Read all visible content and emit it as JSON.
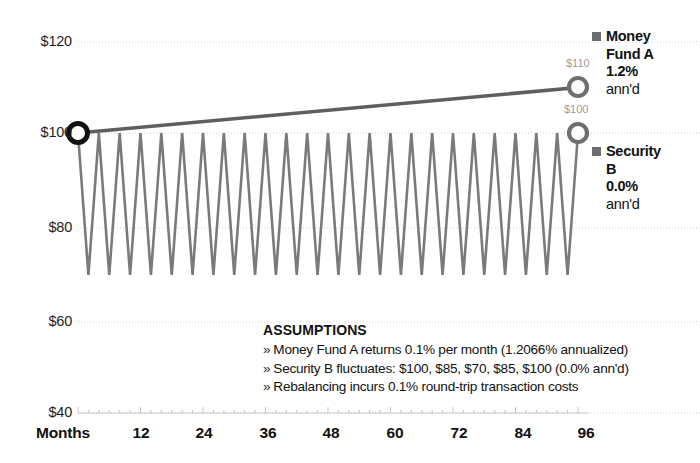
{
  "chart_data": {
    "type": "line",
    "title": "",
    "subtitle": "",
    "xlabel": "Months",
    "ylabel": "",
    "xlim": [
      0,
      96
    ],
    "ylim": [
      40,
      120
    ],
    "grid": true,
    "legend_position": "right",
    "y_ticks": [
      "$40",
      "$60",
      "$80",
      "$100",
      "$120"
    ],
    "y_tick_values": [
      40,
      60,
      80,
      100,
      120
    ],
    "x_ticks": [
      "12",
      "24",
      "36",
      "48",
      "60",
      "72",
      "84",
      "96"
    ],
    "x_tick_values": [
      12,
      24,
      36,
      48,
      60,
      72,
      84,
      96
    ],
    "x_axis_title": "Months",
    "series": [
      {
        "name": "Money Fund A",
        "return_label": "1.2%",
        "return_suffix": "ann'd",
        "color": "#5f5f5f",
        "start_value": 100,
        "end_value": 110,
        "end_label": "$110",
        "start_label": "",
        "description": "Smooth upward line from $100 at month 0 to $110 at month 96",
        "x": [
          0,
          96
        ],
        "values": [
          100,
          110
        ]
      },
      {
        "name": "Security B",
        "return_label": "0.0%",
        "return_suffix": "ann'd",
        "color": "#7a7a7a",
        "start_value": 100,
        "end_value": 100,
        "end_label": "$100",
        "description": "Sawtooth oscillating on a 4-month cycle: $100, $85, $70, $85, $100",
        "cycle_values": [
          100,
          85,
          70,
          85
        ],
        "cycle_length_months": 4,
        "cycles": 24,
        "peak_value": 100,
        "trough_value": 70
      }
    ],
    "markers": [
      {
        "label": "",
        "series": "both",
        "x": 0,
        "y": 100,
        "style": "black-ring"
      },
      {
        "label": "$110",
        "series": "Money Fund A",
        "x": 96,
        "y": 110,
        "style": "gray-ring"
      },
      {
        "label": "$100",
        "series": "Security B",
        "x": 96,
        "y": 100,
        "style": "gray-ring"
      }
    ],
    "annotations": {
      "assumptions_title": "ASSUMPTIONS",
      "assumptions": [
        "Money Fund A returns 0.1% per month (1.2066% annualized)",
        "Security B fluctuates: $100, $85, $70, $85, $100 (0.0% ann'd)",
        "Rebalancing incurs 0.1% round-trip transaction costs"
      ],
      "bullet_glyph": "»"
    }
  },
  "colors": {
    "background": "#ffffff",
    "text": "#111111",
    "gridline": "#cfcfcf",
    "money_fund_line": "#5f5f5f",
    "security_line": "#7a7a7a",
    "swatch": "#6e6e6e",
    "point_label": "#9b9b9b",
    "marker_ring_dark": "#111111",
    "marker_ring_gray": "#6f6f6f"
  },
  "legend": {
    "items": [
      {
        "swatch_name": "legend-swatch-money-fund-a",
        "line1": "Money",
        "line2": "Fund A",
        "line3": "1.2%",
        "line4": "ann'd"
      },
      {
        "swatch_name": "legend-swatch-security-b",
        "line1": "Security",
        "line2": "B",
        "line3": "0.0%",
        "line4": "ann'd"
      }
    ]
  }
}
